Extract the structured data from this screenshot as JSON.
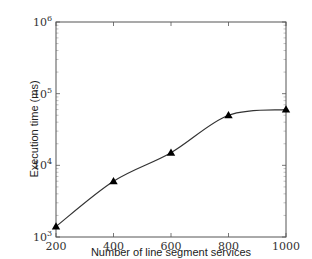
{
  "chart_data": {
    "type": "line",
    "title": "",
    "xlabel": "Number of line segment services",
    "ylabel": "Execution time (ms)",
    "x": [
      200,
      400,
      600,
      800,
      1000
    ],
    "series": [
      {
        "name": "Execution time",
        "marker": "triangle",
        "color": "#000000",
        "values": [
          1400,
          6000,
          15000,
          50000,
          60000
        ]
      }
    ],
    "xlim": [
      200,
      1000
    ],
    "ylim": [
      1000,
      1000000
    ],
    "yscale": "log",
    "x_ticks": [
      "200",
      "400",
      "600",
      "800",
      "1000"
    ],
    "y_ticks": [
      {
        "base": "10",
        "exp": "3",
        "value": 1000
      },
      {
        "base": "10",
        "exp": "4",
        "value": 10000
      },
      {
        "base": "10",
        "exp": "5",
        "value": 100000
      },
      {
        "base": "10",
        "exp": "6",
        "value": 1000000
      }
    ],
    "grid": false,
    "legend": null
  }
}
